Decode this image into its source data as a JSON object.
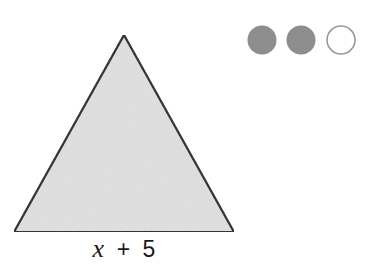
{
  "diagram": {
    "shape": "triangle",
    "base_label": {
      "variable": "x",
      "operator": "+",
      "constant": "5"
    },
    "colors": {
      "triangle_fill": "#e0e0e0",
      "triangle_stroke": "#1a1a1a",
      "filled_circle": "#8a8a8a",
      "empty_circle_stroke": "#9a9a9a"
    }
  },
  "indicator": {
    "circles": [
      {
        "state": "filled"
      },
      {
        "state": "filled"
      },
      {
        "state": "empty"
      }
    ]
  }
}
